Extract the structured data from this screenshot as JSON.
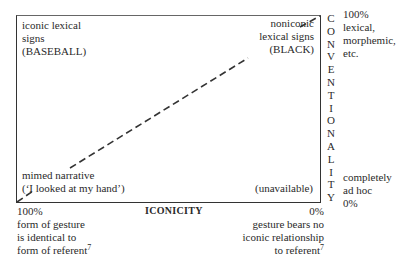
{
  "diagram": {
    "quadrants": {
      "top_left": [
        "iconic lexical",
        "signs",
        "(BASEBALL)"
      ],
      "top_right": [
        "noniconic",
        "lexical signs",
        "(BLACK)"
      ],
      "bottom_left": [
        "mimed narrative",
        "(‘I looked at my hand’)"
      ],
      "bottom_right": [
        "(unavailable)"
      ]
    },
    "y_axis": {
      "label": "CONVENTIONALITY",
      "letters": [
        "C",
        "O",
        "N",
        "V",
        "E",
        "N",
        "T",
        "I",
        "O",
        "N",
        "A",
        "L",
        "I",
        "T",
        "Y"
      ],
      "top": [
        "100%",
        "lexical,",
        "morphemic,",
        "etc."
      ],
      "bottom": [
        "completely",
        "ad hoc",
        "0%"
      ]
    },
    "x_axis": {
      "label": "ICONICITY",
      "left": [
        "100%",
        "form of gesture",
        "is identical to",
        "form of referent"
      ],
      "left_footnote": "7",
      "right": [
        "0%",
        "gesture bears no",
        "iconic relationship",
        "to referent"
      ],
      "right_footnote": "7"
    },
    "line": {
      "style": "dashed",
      "from": "bottom-left",
      "to": "top-right"
    }
  }
}
